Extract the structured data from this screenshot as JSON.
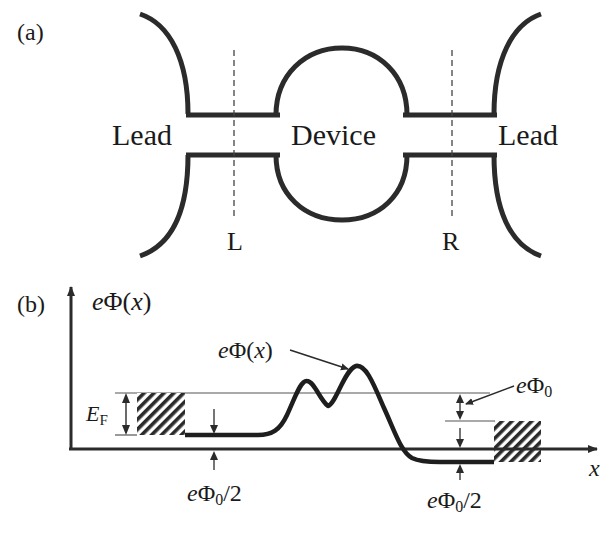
{
  "panel_a": {
    "label": "(a)",
    "left_lead": "Lead",
    "device": "Device",
    "right_lead": "Lead",
    "cut_left": "L",
    "cut_right": "R"
  },
  "panel_b": {
    "label": "(b)",
    "y_axis_label_e": "e",
    "y_axis_label_phi": "Φ(",
    "y_axis_label_x": "x",
    "y_axis_label_close": ")",
    "curve_label_e": "e",
    "curve_label_phi": "Φ",
    "curve_label_open": "(",
    "curve_label_x": "x",
    "curve_label_close": ")",
    "fermi_E": "E",
    "fermi_sub": "F",
    "phi0_e": "e",
    "phi0_phi": "Φ",
    "phi0_sub": "0",
    "left_half_e": "e",
    "left_half_phi": "Φ",
    "left_half_sub": "0",
    "left_half_rest": "/2",
    "right_half_e": "e",
    "right_half_phi": "Φ",
    "right_half_sub": "0",
    "right_half_rest": "/2",
    "x_axis_label": "x"
  },
  "colors": {
    "stroke": "#2b2b2b",
    "thin_line": "#555555",
    "background": "#ffffff"
  }
}
